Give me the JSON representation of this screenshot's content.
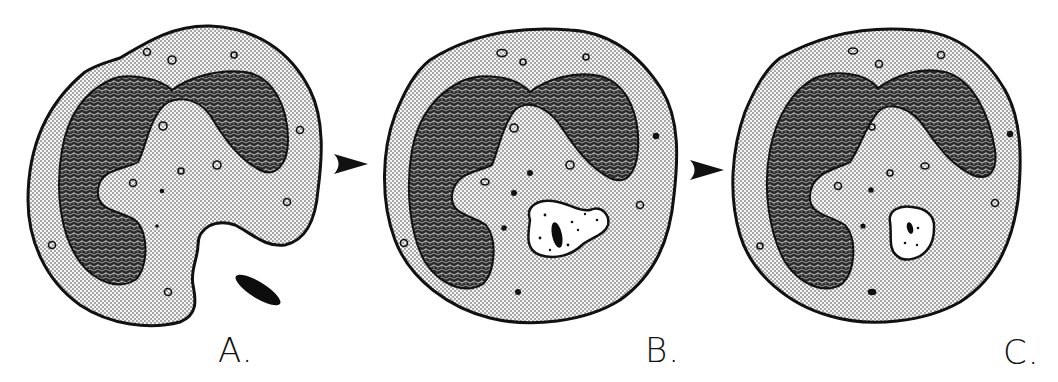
{
  "figure": {
    "panels": [
      {
        "id": "A",
        "label": "A.",
        "stage": "bacterium approaching cell membrane",
        "has_vacuole": false,
        "has_external_bacterium": true
      },
      {
        "id": "B",
        "label": "B.",
        "stage": "bacterium engulfed in large phagocytic vacuole",
        "has_vacuole": true,
        "vacuole_size": "large"
      },
      {
        "id": "C",
        "label": "C.",
        "stage": "vacuole shrinking, bacterium degrading",
        "has_vacuole": true,
        "vacuole_size": "small"
      }
    ],
    "arrows": [
      {
        "from": "A",
        "to": "B",
        "icon": "arrowhead-right-icon"
      },
      {
        "from": "B",
        "to": "C",
        "icon": "arrowhead-right-icon"
      }
    ]
  },
  "colors": {
    "background": "#ffffff",
    "ink": "#111111",
    "cytoplasm_stipple": "#bdbdbd",
    "nucleus": "#2a2a2a"
  }
}
